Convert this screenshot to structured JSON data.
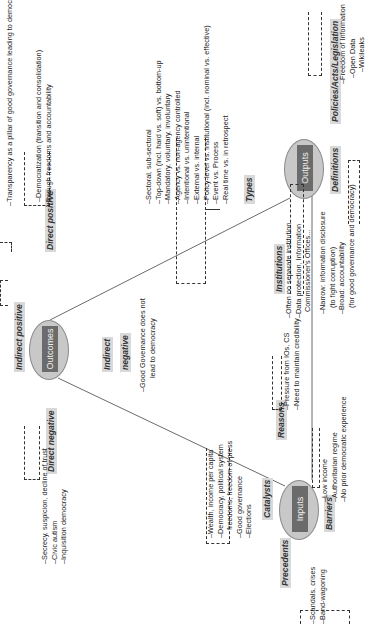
{
  "nodes": {
    "outcomes": "Outcomes",
    "outputs": "Outputs",
    "inputs": "Inputs"
  },
  "outcomes": {
    "indirect_positive": {
      "label": "Indirect positive"
    },
    "direct_positive": {
      "label": "Direct positive",
      "items": [
        "–Democratization (transition and consolidation)",
        "through freedoms and accountability"
      ]
    },
    "top_item": "–Transparency as a pillar of good governance leading to democratization",
    "direct_negative": {
      "label": "Direct negative",
      "items": [
        "–Secrecy, suspicion, decline of trust",
        "–Civic autism",
        "–Inquisition democracy"
      ]
    },
    "indirect_negative": {
      "label_line1": "Indirect",
      "label_line2": "negative",
      "items": [
        "–Good Governance does not",
        "lead to democracy"
      ]
    }
  },
  "outputs": {
    "types": {
      "label": "Types",
      "items": [
        "–Sectoral, sub-sectoral",
        "–Top-down (incl. hard vs. soft) vs. bottom-up",
        "–Mandatory, voluntary, involuntary",
        "–Agency vs. non-agency controlled",
        "–Intentional vs. unintentional",
        "–External vs. internal",
        "–Policy-level vs. institutional (incl. nominal vs. effective)",
        "–Event vs. Process",
        "–Real time vs. in retrospect"
      ]
    },
    "policies": {
      "label": "Policies/Acts/Legislation",
      "items": [
        "–Freedom of Information",
        "–Open Data",
        "–Wikileaks"
      ]
    },
    "institutions": {
      "label": "Institutions",
      "items": [
        "–Often no separate institution",
        "–Data protection, Information",
        "Commissioner's Offices..."
      ]
    },
    "definitions": {
      "label": "Definitions",
      "items": [
        "–Narrow: information disclosure",
        "(to fight corruption)",
        "–Broad: accountability",
        "(for good governance and democracy)"
      ]
    }
  },
  "inputs": {
    "catalysts": {
      "label": "Catalysts",
      "items": [
        "–Wealth, income per capita",
        "–Democracy, political system",
        "freedoms, freedom of press",
        "–Good governance",
        "–Elections"
      ]
    },
    "precedents": {
      "label": "Precedents",
      "items": [
        "–Scandals, crises",
        "–Band-wagoning"
      ]
    },
    "reasons": {
      "label": "Reasons",
      "items": [
        "–Pressure from IOs, CS",
        "–Need to maintain credibility"
      ]
    },
    "barriers": {
      "label": "Barriers",
      "items": [
        "–Low income",
        "–Authoritarian regime",
        "–No prior democratic experience"
      ]
    }
  }
}
